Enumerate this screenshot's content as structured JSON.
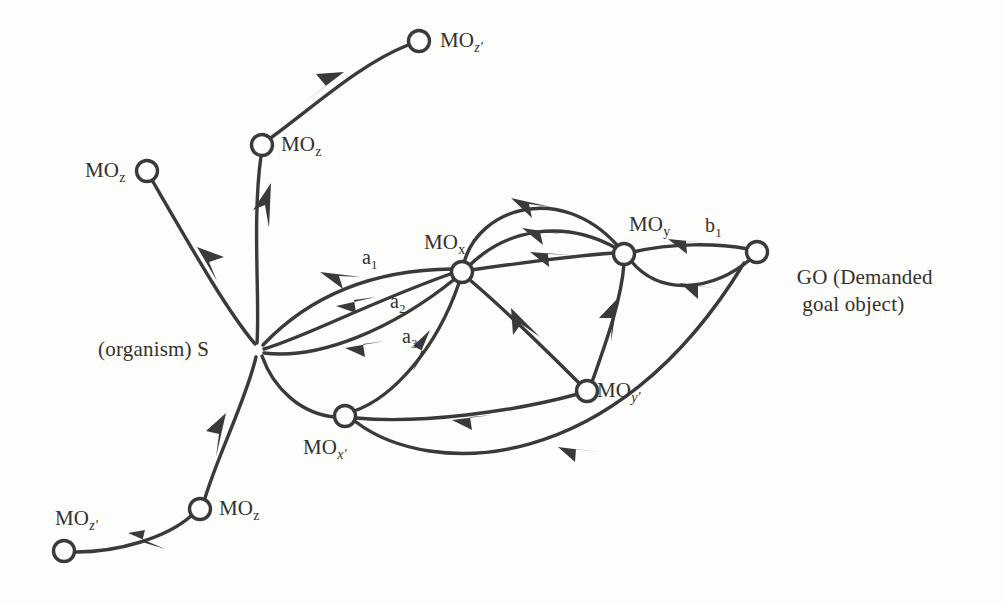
{
  "figure": {
    "kind": "directed-graph-diagram",
    "background_color": "#fdfdfc",
    "ink_color": "#3a3a3a",
    "width": 1004,
    "height": 604
  },
  "nodes": [
    {
      "id": "mo_z_prime_top",
      "base": "MO",
      "sub": "z'",
      "label": "MO",
      "x": 419,
      "y": 41,
      "label_x": 440,
      "label_y": 28,
      "has_circle": true
    },
    {
      "id": "mo_z_top",
      "base": "MO",
      "sub": "z",
      "label": "MO",
      "x": 262,
      "y": 145,
      "label_x": 281,
      "label_y": 132,
      "has_circle": true
    },
    {
      "id": "mo_z_left",
      "base": "MO",
      "sub": "z",
      "label": "MO",
      "x": 147,
      "y": 171,
      "label_x": 85,
      "label_y": 158,
      "has_circle": true
    },
    {
      "id": "s_organism",
      "base": "(organism) S",
      "sub": "",
      "label": "(organism) S",
      "x": 258,
      "y": 350,
      "label_x": 98,
      "label_y": 337,
      "has_circle": false
    },
    {
      "id": "mo_x",
      "base": "MO",
      "sub": "x",
      "label": "MO",
      "x": 462,
      "y": 272,
      "label_x": 424,
      "label_y": 230,
      "has_circle": true
    },
    {
      "id": "mo_y",
      "base": "MO",
      "sub": "y",
      "label": "MO",
      "x": 624,
      "y": 254,
      "label_x": 629,
      "label_y": 212,
      "has_circle": true
    },
    {
      "id": "go",
      "base": "GO",
      "sub": "",
      "label": "GO (Demanded\n     goal object)",
      "x": 757,
      "y": 252,
      "label_x": 775,
      "label_y": 238,
      "has_circle": true
    },
    {
      "id": "mo_x_prime",
      "base": "MO",
      "sub": "x'",
      "label": "MO",
      "x": 345,
      "y": 416,
      "label_x": 303,
      "label_y": 435,
      "has_circle": true
    },
    {
      "id": "mo_y_prime",
      "base": "MO",
      "sub": "y'",
      "label": "MO",
      "x": 587,
      "y": 391,
      "label_x": 597,
      "label_y": 378,
      "has_circle": true
    },
    {
      "id": "mo_z_bottom",
      "base": "MO",
      "sub": "z",
      "label": "MO",
      "x": 200,
      "y": 509,
      "label_x": 219,
      "label_y": 496,
      "has_circle": true
    },
    {
      "id": "mo_z_prime_bottom",
      "base": "MO",
      "sub": "z'",
      "label": "MO",
      "x": 64,
      "y": 551,
      "label_x": 55,
      "label_y": 506,
      "has_circle": true
    }
  ],
  "edge_labels": [
    {
      "id": "a1",
      "base": "a",
      "sub": "1",
      "x": 362,
      "y": 246
    },
    {
      "id": "a2",
      "base": "a",
      "sub": "2",
      "x": 390,
      "y": 290
    },
    {
      "id": "a3",
      "base": "a",
      "sub": "3",
      "x": 402,
      "y": 325
    },
    {
      "id": "b1",
      "base": "b",
      "sub": "1",
      "x": 705,
      "y": 214
    }
  ],
  "edges": [
    {
      "id": "e-s-to-moz-left",
      "from": "s_organism",
      "to": "mo_z_left",
      "arrow": true,
      "note": "S up-left to MO z"
    },
    {
      "id": "e-s-to-moz-top",
      "from": "s_organism",
      "to": "mo_z_top",
      "arrow": true,
      "note": "S up to MO z"
    },
    {
      "id": "e-moz-to-mozprime",
      "from": "mo_z_top",
      "to": "mo_z_prime_top",
      "arrow": true,
      "note": "MO z to MO z prime, top"
    },
    {
      "id": "e-s-to-mox-a1",
      "from": "s_organism",
      "to": "mo_x",
      "arrow": true,
      "label": "a1"
    },
    {
      "id": "e-s-to-mox-a2",
      "from": "s_organism",
      "to": "mo_x",
      "arrow": true,
      "label": "a2"
    },
    {
      "id": "e-s-to-mox-a3",
      "from": "s_organism",
      "to": "mo_x",
      "arrow": true,
      "label": "a3"
    },
    {
      "id": "e-mox-to-moy-arc",
      "from": "mo_x",
      "to": "mo_y",
      "arrow": true,
      "note": "upper arc"
    },
    {
      "id": "e-mox-to-moy-mid",
      "from": "mo_x",
      "to": "mo_y",
      "arrow": true,
      "note": "middle"
    },
    {
      "id": "e-mox-to-moy-low",
      "from": "mo_x",
      "to": "mo_y",
      "arrow": true,
      "note": "straight"
    },
    {
      "id": "e-moy-to-go-b1",
      "from": "mo_y",
      "to": "go",
      "arrow": true,
      "label": "b1"
    },
    {
      "id": "e-moy-to-go-low",
      "from": "mo_y",
      "to": "go",
      "arrow": true,
      "note": "lower arc"
    },
    {
      "id": "e-mox-to-moyprime",
      "from": "mo_x",
      "to": "mo_y_prime",
      "arrow": true
    },
    {
      "id": "e-moy-to-moyprime",
      "from": "mo_y",
      "to": "mo_y_prime",
      "arrow": true
    },
    {
      "id": "e-s-to-moxprime",
      "from": "s_organism",
      "to": "mo_x_prime",
      "arrow": false
    },
    {
      "id": "e-moxprime-to-mox",
      "from": "mo_x_prime",
      "to": "mo_x",
      "arrow": true
    },
    {
      "id": "e-moxprime-to-moyprime",
      "from": "mo_x_prime",
      "to": "mo_y_prime",
      "arrow": true
    },
    {
      "id": "e-moxprime-to-go",
      "from": "mo_x_prime",
      "to": "go",
      "arrow": true,
      "note": "long lower curve"
    },
    {
      "id": "e-s-to-mozbottom",
      "from": "s_organism",
      "to": "mo_z_bottom",
      "arrow": true
    },
    {
      "id": "e-mozbottom-to-mozprime",
      "from": "mo_z_bottom",
      "to": "mo_z_prime_bottom",
      "arrow": true
    }
  ]
}
